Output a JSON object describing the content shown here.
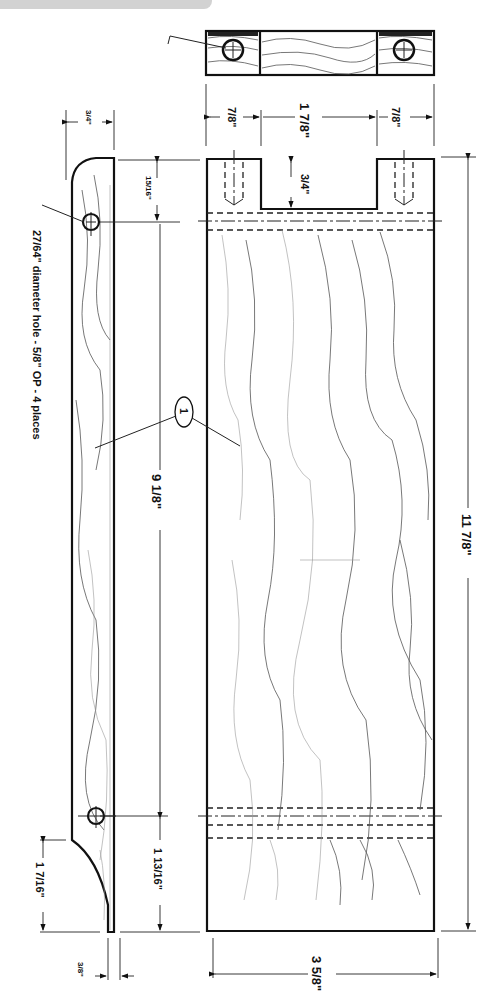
{
  "header": {
    "banner_text": ""
  },
  "drawing": {
    "part_number": "1",
    "note": {
      "hole_size": "27/64\"",
      "text": "diameter hole - ",
      "depth": "5/8\"",
      "text2": " OP - 4 places",
      "full": "27/64\" diameter hole - 5/8\" OP - 4 places"
    },
    "end_view": {
      "dims": {
        "left": "7/8\"",
        "middle": "1 7/8\"",
        "right": "7/8\""
      }
    },
    "front_view": {
      "dims": {
        "notch_depth": "3/4\"",
        "overall_length": "11 7/8\"",
        "width": "3 5/8\""
      }
    },
    "side_view": {
      "dims": {
        "top_thickness": "3/4\"",
        "top_hole_offset": "15/16\"",
        "hole_spacing": "9 1/8\"",
        "bottom_hole_offset": "1 13/16\"",
        "curve_length": "1 7/16\"",
        "bottom_thickness": "3/8\""
      }
    }
  }
}
